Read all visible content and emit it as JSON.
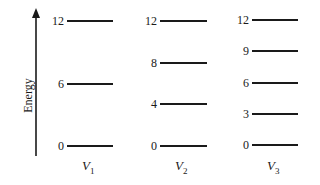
{
  "axis": {
    "label": "Energy"
  },
  "columns": [
    {
      "name": "V",
      "sub": "1",
      "levels": [
        12,
        6,
        0
      ]
    },
    {
      "name": "V",
      "sub": "2",
      "levels": [
        12,
        8,
        4,
        0
      ]
    },
    {
      "name": "V",
      "sub": "3",
      "levels": [
        12,
        9,
        6,
        3,
        0
      ]
    }
  ],
  "labels": {
    "v1": {
      "l12": "12",
      "l6": "6",
      "l0": "0"
    },
    "v2": {
      "l12": "12",
      "l8": "8",
      "l4": "4",
      "l0": "0"
    },
    "v3": {
      "l12": "12",
      "l9": "9",
      "l6": "6",
      "l3": "3",
      "l0": "0"
    }
  }
}
